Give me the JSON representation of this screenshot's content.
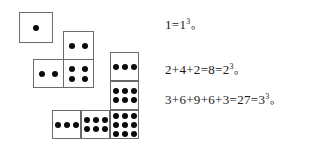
{
  "figure": {
    "dice_groups": [
      {
        "name": "group-1",
        "label": "1 dot square",
        "squares": [
          {
            "dots": 1,
            "rows": 1,
            "cols": 1,
            "x": 19,
            "y": 12
          }
        ]
      },
      {
        "name": "group-2",
        "label": "2 + 4 + 2 squares",
        "squares": [
          {
            "dots": 2,
            "rows": 1,
            "cols": 2,
            "x": 63,
            "y": 31
          },
          {
            "dots": 2,
            "rows": 1,
            "cols": 2,
            "x": 33,
            "y": 59
          },
          {
            "dots": 4,
            "rows": 2,
            "cols": 2,
            "x": 63,
            "y": 59
          }
        ]
      },
      {
        "name": "group-3",
        "label": "3 + 6 + 9 + 6 + 3 squares",
        "squares": [
          {
            "dots": 3,
            "rows": 1,
            "cols": 3,
            "x": 110,
            "y": 52
          },
          {
            "dots": 6,
            "rows": 2,
            "cols": 3,
            "x": 110,
            "y": 81
          },
          {
            "dots": 9,
            "rows": 3,
            "cols": 3,
            "x": 110,
            "y": 110
          },
          {
            "dots": 3,
            "rows": 1,
            "cols": 3,
            "x": 52,
            "y": 110
          },
          {
            "dots": 6,
            "rows": 2,
            "cols": 3,
            "x": 81,
            "y": 110
          }
        ]
      }
    ],
    "colors": {
      "dot": "#0a0a0a",
      "square_border": "#6b6b6b",
      "text": "#1a1a1a",
      "background": "#ffffff"
    }
  },
  "equations": [
    {
      "name": "equation-1",
      "terms": "1=1",
      "exponent": "3",
      "punctuation": "。",
      "full_text": "1=1³。"
    },
    {
      "name": "equation-2",
      "terms": "2+4+2=8=2",
      "exponent": "3",
      "punctuation": "。",
      "full_text": "2+4+2=8=2³。"
    },
    {
      "name": "equation-3",
      "terms": "3+6+9+6+3=27=3",
      "exponent": "3",
      "punctuation": "。",
      "full_text": "3+6+9+6+3=27=3³。"
    }
  ]
}
